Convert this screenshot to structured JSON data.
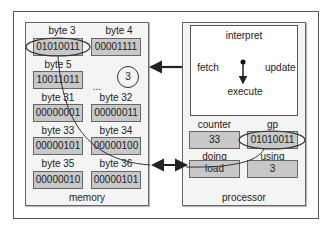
{
  "memory": {
    "title": "memory",
    "cells": [
      {
        "label": "byte 3",
        "value": "01010011"
      },
      {
        "label": "byte 4",
        "value": "00001111"
      },
      {
        "label": "byte 5",
        "value": "10011011"
      },
      {
        "label": "byte 31",
        "value": "00000001"
      },
      {
        "label": "byte 32",
        "value": "00000011"
      },
      {
        "label": "byte 33",
        "value": "00000101"
      },
      {
        "label": "byte 34",
        "value": "00000100"
      },
      {
        "label": "byte 35",
        "value": "00000010"
      },
      {
        "label": "byte 36",
        "value": "00000101"
      }
    ],
    "ellipsis": "...",
    "step_marker": "3"
  },
  "processor": {
    "title": "processor",
    "cycle": {
      "top": "interpret",
      "left": "fetch",
      "right": "update",
      "bottom": "execute"
    },
    "registers": [
      {
        "label": "counter",
        "value": "33"
      },
      {
        "label": "gp",
        "value": "01010011"
      },
      {
        "label": "doing",
        "value": "load"
      },
      {
        "label": "using",
        "value": "3"
      }
    ]
  },
  "colors": {
    "cell_fill": "#c8c8c8",
    "panel_fill": "#f4f4f4",
    "line": "#333333"
  }
}
